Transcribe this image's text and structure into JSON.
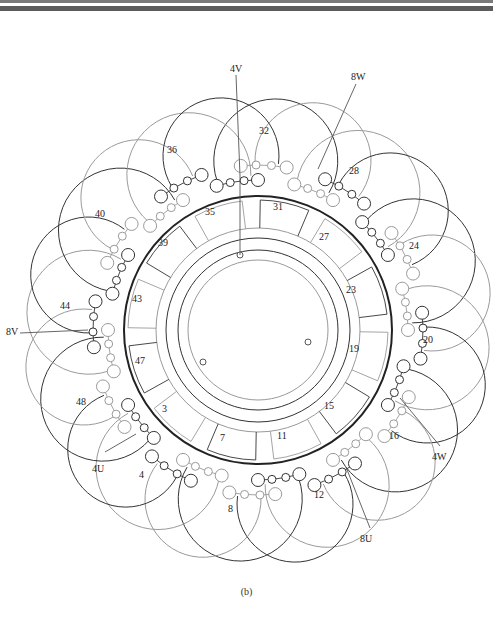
{
  "figure": {
    "caption": "(b)",
    "colors": {
      "dark_line": "#333333",
      "light_line": "#9a9a9a",
      "stator_ring": "#222222",
      "label": "#222222"
    }
  },
  "terminals": [
    {
      "id": "4V",
      "label": "4V"
    },
    {
      "id": "8W",
      "label": "8W"
    },
    {
      "id": "4W",
      "label": "4W"
    },
    {
      "id": "8U",
      "label": "8U"
    },
    {
      "id": "4U",
      "label": "4U"
    },
    {
      "id": "8V",
      "label": "8V"
    }
  ],
  "inner_slot_labels": [
    "31",
    "27",
    "23",
    "19",
    "15",
    "11",
    "7",
    "3",
    "47",
    "43",
    "39",
    "35"
  ],
  "outer_coil_labels": [
    "32",
    "28",
    "24",
    "20",
    "16",
    "12",
    "8",
    "4",
    "48",
    "44",
    "40",
    "36"
  ]
}
